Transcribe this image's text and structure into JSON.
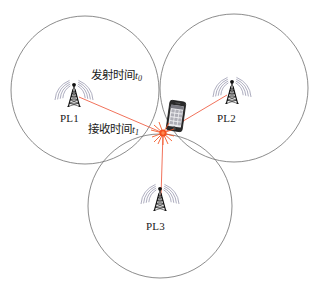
{
  "figure": {
    "type": "tdoa-trilateration-diagram",
    "background_color": "#ffffff",
    "circle_stroke": "#6e6e6e",
    "ray_color": "#ef6248",
    "marker_color": "#f4511e",
    "text_color": "#1a1a1a"
  },
  "circles": [
    {
      "id": "circle-pl1",
      "cx": 85,
      "cy": 90,
      "r": 74
    },
    {
      "id": "circle-pl2",
      "cx": 234,
      "cy": 88,
      "r": 74
    },
    {
      "id": "circle-pl3",
      "cx": 160,
      "cy": 206,
      "r": 72
    }
  ],
  "stations": [
    {
      "id": "pl1",
      "label": "PL1",
      "x": 74,
      "y": 96,
      "label_x": 60,
      "label_y": 117
    },
    {
      "id": "pl2",
      "label": "PL2",
      "x": 232,
      "y": 93,
      "label_x": 217,
      "label_y": 117
    },
    {
      "id": "pl3",
      "label": "PL3",
      "x": 160,
      "y": 200,
      "label_x": 146,
      "label_y": 224
    }
  ],
  "receiver": {
    "id": "mobile-phone",
    "x": 176,
    "y": 116,
    "marker_x": 164,
    "marker_y": 133
  },
  "annotations": {
    "transmit": {
      "text": "发射时间",
      "variable": "t",
      "subscript": "0",
      "x": 91,
      "y": 73
    },
    "receive": {
      "text": "接收时间",
      "variable": "t",
      "subscript": "1",
      "x": 88,
      "y": 126
    }
  },
  "rays": [
    {
      "id": "ray-pl1",
      "from": "pl1",
      "x1": 78,
      "y1": 97,
      "x2": 164,
      "y2": 133
    },
    {
      "id": "ray-pl2",
      "from": "pl2",
      "x1": 228,
      "y1": 94,
      "x2": 164,
      "y2": 133
    },
    {
      "id": "ray-pl3",
      "from": "pl3",
      "x1": 161,
      "y1": 197,
      "x2": 164,
      "y2": 133
    }
  ]
}
